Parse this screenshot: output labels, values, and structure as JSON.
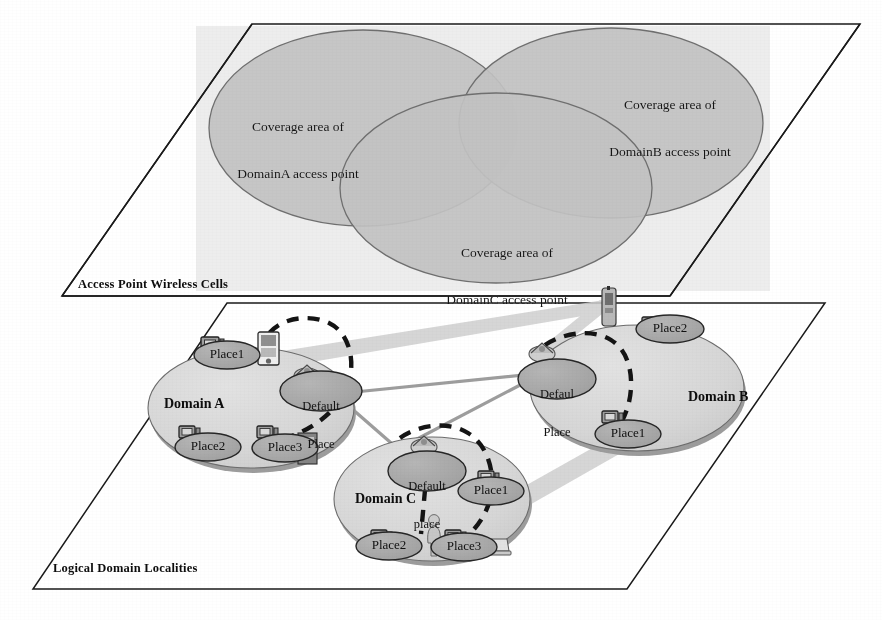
{
  "figure": {
    "type": "architecture-diagram",
    "planes": [
      {
        "id": "access-point-plane",
        "caption": "Access Point Wireless Cells"
      },
      {
        "id": "logical-domain-plane",
        "caption": "Logical Domain Localities"
      }
    ]
  },
  "coverage_cells": [
    {
      "id": "cellA",
      "line1": "Coverage area of",
      "line2": "DomainA access point"
    },
    {
      "id": "cellB",
      "line1": "Coverage area of",
      "line2": "DomainB access point"
    },
    {
      "id": "cellC",
      "line1": "Coverage area of",
      "line2": "DomainC access point"
    }
  ],
  "domains": [
    {
      "id": "domainA",
      "title": "Domain A",
      "places": [
        {
          "id": "a-place1",
          "label": "Place1"
        },
        {
          "id": "a-default",
          "line1": "Default",
          "line2": "Place"
        },
        {
          "id": "a-place2",
          "label": "Place2"
        },
        {
          "id": "a-place3",
          "label": "Place3"
        }
      ]
    },
    {
      "id": "domainB",
      "title": "Domain B",
      "places": [
        {
          "id": "b-place2",
          "label": "Place2"
        },
        {
          "id": "b-default",
          "line1": "Defaul",
          "line2": "Place"
        },
        {
          "id": "b-place1",
          "label": "Place1"
        }
      ]
    },
    {
      "id": "domainC",
      "title": "Domain C",
      "places": [
        {
          "id": "c-default",
          "line1": "Default",
          "line2": "place"
        },
        {
          "id": "c-place1",
          "label": "Place1"
        },
        {
          "id": "c-place2",
          "label": "Place2"
        },
        {
          "id": "c-place3",
          "label": "Place3"
        }
      ]
    }
  ],
  "colors": {
    "plane_outline": "#1a1a1a",
    "cell_band": "#e9e9e9",
    "cell_fill": "#bdbdbd",
    "domain_fill": "#d8d8d8",
    "domain_shadow": "#9a9a9a",
    "place_fill": "#a9a9a9",
    "place_stroke": "#2a2a2a",
    "beam": "#c9c9c9",
    "link_line": "#9b9b9b",
    "dashed_path": "#111111",
    "text": "#111111"
  },
  "icons": {
    "workstation": "workstation-icon",
    "pda": "pda-icon",
    "mobile_agent": "mobile-agent-icon",
    "person": "person-icon",
    "access_point": "access-point-icon"
  }
}
